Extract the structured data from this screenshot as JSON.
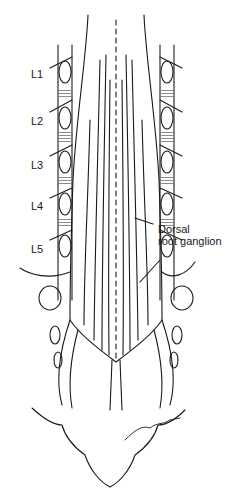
{
  "figure": {
    "vertebra_labels": [
      {
        "id": "L1",
        "text": "L1",
        "x": 31,
        "y": 74
      },
      {
        "id": "L2",
        "text": "L2",
        "x": 31,
        "y": 121
      },
      {
        "id": "L3",
        "text": "L3",
        "x": 31,
        "y": 165
      },
      {
        "id": "L4",
        "text": "L4",
        "x": 31,
        "y": 206
      },
      {
        "id": "L5",
        "text": "L5",
        "x": 31,
        "y": 249
      }
    ],
    "annotations": [
      {
        "id": "dorsal-root-ganglion",
        "line1": "Dorsal",
        "line2": "root ganglion",
        "x": 158,
        "y": 228
      }
    ],
    "colors": {
      "ink": "#1a1a1a",
      "background": "#ffffff"
    }
  }
}
